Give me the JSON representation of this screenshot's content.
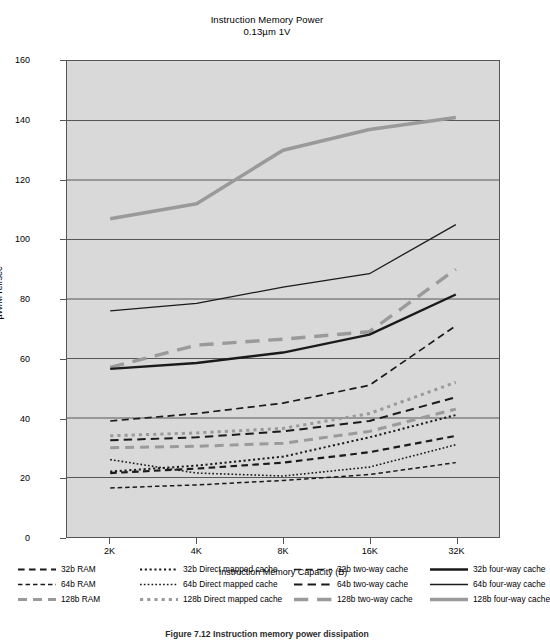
{
  "chart_data": {
    "type": "line",
    "title": "Instruction Memory Power",
    "subtitle": "0.13µm 1V",
    "xlabel": "Instruction Memory Capacity (B)",
    "ylabel": "µW/M ref/sec",
    "categories": [
      "2K",
      "4K",
      "8K",
      "16K",
      "32K"
    ],
    "ylim": [
      0,
      160
    ],
    "yticks": [
      0,
      20,
      40,
      60,
      80,
      100,
      120,
      140,
      160
    ],
    "grid": "horizontal",
    "legend_position": "bottom",
    "plot_background": "#d9d9d9",
    "colors": {
      "dark": "#1a1a1a",
      "gray": "#9a9a9a",
      "grid": "#555555"
    },
    "series": [
      {
        "name": "32b RAM",
        "values": [
          21.5,
          23.0,
          25.0,
          28.5,
          34.0
        ],
        "style": "dashed",
        "color": "#1a1a1a",
        "width": 2.2
      },
      {
        "name": "64b RAM",
        "values": [
          16.5,
          17.5,
          19.0,
          21.0,
          25.0
        ],
        "style": "dashed",
        "color": "#1a1a1a",
        "width": 1.5
      },
      {
        "name": "128b RAM",
        "values": [
          30.0,
          30.5,
          31.5,
          35.5,
          43.0
        ],
        "style": "dashed",
        "color": "#9a9a9a",
        "width": 3.0
      },
      {
        "name": "32b Direct mapped cache",
        "values": [
          22.0,
          24.0,
          27.0,
          33.5,
          41.0
        ],
        "style": "dotted",
        "color": "#1a1a1a",
        "width": 2.0
      },
      {
        "name": "64b Direct mapped cache",
        "values": [
          26.0,
          21.5,
          20.5,
          23.5,
          31.0
        ],
        "style": "dotted",
        "color": "#1a1a1a",
        "width": 1.6
      },
      {
        "name": "128b Direct mapped cache",
        "values": [
          34.0,
          35.0,
          36.5,
          41.5,
          52.0
        ],
        "style": "dotted",
        "color": "#9a9a9a",
        "width": 3.0
      },
      {
        "name": "32b two-way cache",
        "values": [
          39.0,
          41.5,
          45.0,
          51.0,
          71.0
        ],
        "style": "long-dashed",
        "color": "#1a1a1a",
        "width": 1.7
      },
      {
        "name": "64b two-way cache",
        "values": [
          32.5,
          33.5,
          35.5,
          39.0,
          47.0
        ],
        "style": "long-dashed",
        "color": "#1a1a1a",
        "width": 2.0
      },
      {
        "name": "128b two-way cache",
        "values": [
          57.0,
          64.5,
          66.5,
          69.0,
          90.0
        ],
        "style": "long-dashed",
        "color": "#9a9a9a",
        "width": 3.4
      },
      {
        "name": "32b four-way cache",
        "values": [
          56.5,
          58.5,
          62.0,
          68.0,
          81.5
        ],
        "style": "solid",
        "color": "#1a1a1a",
        "width": 2.4
      },
      {
        "name": "64b four-way cache",
        "values": [
          76.0,
          78.5,
          84.0,
          88.5,
          105.0
        ],
        "style": "solid",
        "color": "#1a1a1a",
        "width": 1.3
      },
      {
        "name": "128b four-way cache",
        "values": [
          107.0,
          112.0,
          130.0,
          137.0,
          141.0
        ],
        "style": "solid",
        "color": "#9a9a9a",
        "width": 3.6
      }
    ]
  },
  "legend": {
    "columns": [
      [
        "32b RAM",
        "64b RAM",
        "128b RAM"
      ],
      [
        "32b Direct mapped cache",
        "64b Direct mapped cache",
        "128b Direct mapped cache"
      ],
      [
        "32b two-way cache",
        "64b two-way cache",
        "128b two-way cache"
      ],
      [
        "32b four-way cache",
        "64b four-way cache",
        "128b four-way cache"
      ]
    ]
  },
  "caption": "Figure 7.12 Instruction memory power dissipation"
}
